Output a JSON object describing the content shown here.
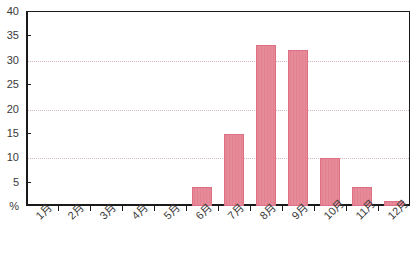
{
  "chart_data": {
    "type": "bar",
    "title": "",
    "xlabel": "",
    "ylabel": "%",
    "categories": [
      "1月",
      "2月",
      "3月",
      "4月",
      "5月",
      "6月",
      "7月",
      "8月",
      "9月",
      "10月",
      "11月",
      "12月"
    ],
    "values": [
      0,
      0,
      0,
      0,
      0,
      4.0,
      14.8,
      33.0,
      32.0,
      9.8,
      4.0,
      1.0
    ],
    "ylim": [
      0,
      40
    ],
    "ytick_values": [
      0,
      5,
      10,
      15,
      20,
      25,
      30,
      35,
      40
    ],
    "ytick_labels": [
      "%",
      "5",
      "10",
      "15",
      "20",
      "25",
      "30",
      "35",
      "40"
    ],
    "gridlines_at": [
      10,
      20,
      30
    ],
    "grid": true,
    "legend": "none",
    "bar_color": "#e4808f",
    "bar_border_color": "#dd7183",
    "grid_color": "#d9b8bd",
    "axis_color": "#1a1a1a",
    "text_color": "#3a3a3a"
  }
}
